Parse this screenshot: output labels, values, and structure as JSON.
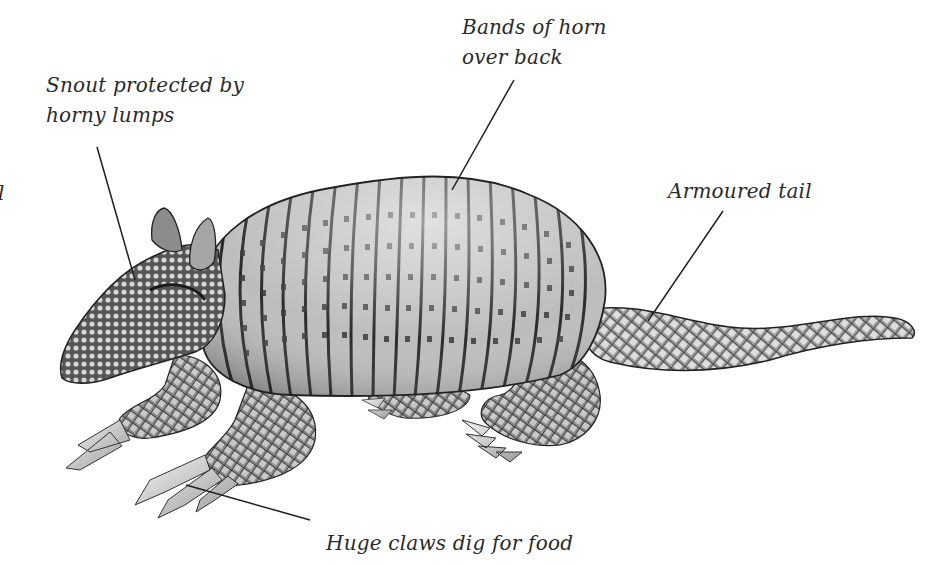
{
  "diagram": {
    "colors": {
      "background": "#ffffff",
      "ink": "#2a2a2a",
      "leader": "#1e1e1e"
    },
    "labels": [
      {
        "id": "snout",
        "lines": [
          "Snout protected by",
          "horny lumps"
        ],
        "x": 46,
        "y": 72
      },
      {
        "id": "bands",
        "lines": [
          "Bands of horn",
          "over back"
        ],
        "x": 462,
        "y": 14
      },
      {
        "id": "tail",
        "lines": [
          "Armoured tail"
        ],
        "x": 668,
        "y": 178
      },
      {
        "id": "claws",
        "lines": [
          "Huge claws dig for food"
        ],
        "x": 326,
        "y": 530
      },
      {
        "id": "clipped",
        "lines": [
          "l"
        ],
        "x": 0,
        "y": 180
      }
    ],
    "leaders": [
      {
        "for": "snout",
        "x1": 97,
        "y1": 147,
        "x2": 135,
        "y2": 280
      },
      {
        "for": "bands",
        "x1": 514,
        "y1": 80,
        "x2": 452,
        "y2": 190
      },
      {
        "for": "tail",
        "x1": 723,
        "y1": 211,
        "x2": 648,
        "y2": 321
      },
      {
        "for": "claws",
        "x1": 310,
        "y1": 520,
        "x2": 186,
        "y2": 485
      }
    ]
  }
}
